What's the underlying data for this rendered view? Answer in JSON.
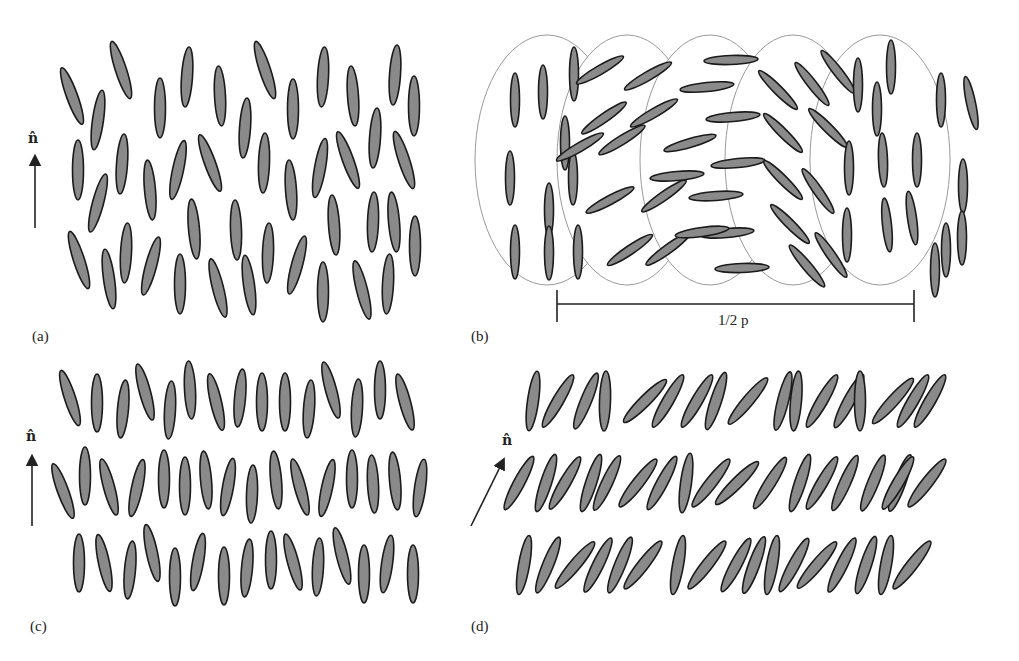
{
  "panels": {
    "a": {
      "label": "(a)",
      "director": "n̂"
    },
    "b": {
      "label": "(b)",
      "pitch_label": "1/2 p"
    },
    "c": {
      "label": "(c)",
      "director": "n̂"
    },
    "d": {
      "label": "(d)",
      "director": "n̂"
    }
  },
  "colors": {
    "molecule_fill": "#8a8a8a",
    "molecule_stroke": "#1a1a1a",
    "circle_stroke": "#9a9a9a",
    "ink": "#222222"
  },
  "molecule": {
    "rx": 5.5,
    "ry": 30
  },
  "molecules": {
    "a": [
      [
        72,
        96,
        -20
      ],
      [
        98,
        120,
        8
      ],
      [
        121,
        70,
        -18
      ],
      [
        160,
        108,
        0
      ],
      [
        187,
        77,
        4
      ],
      [
        220,
        96,
        -3
      ],
      [
        265,
        70,
        -18
      ],
      [
        293,
        109,
        0
      ],
      [
        323,
        77,
        3
      ],
      [
        353,
        96,
        -4
      ],
      [
        395,
        75,
        4
      ],
      [
        414,
        106,
        0
      ],
      [
        78,
        170,
        0
      ],
      [
        98,
        203,
        15
      ],
      [
        122,
        164,
        4
      ],
      [
        150,
        190,
        -5
      ],
      [
        178,
        170,
        12
      ],
      [
        210,
        163,
        -20
      ],
      [
        245,
        128,
        4
      ],
      [
        264,
        163,
        2
      ],
      [
        291,
        190,
        -4
      ],
      [
        320,
        168,
        10
      ],
      [
        348,
        160,
        -20
      ],
      [
        375,
        138,
        4
      ],
      [
        404,
        160,
        -18
      ],
      [
        79,
        260,
        -18
      ],
      [
        109,
        279,
        -8
      ],
      [
        126,
        253,
        3
      ],
      [
        151,
        266,
        15
      ],
      [
        180,
        284,
        0
      ],
      [
        194,
        229,
        -5
      ],
      [
        218,
        288,
        -14
      ],
      [
        236,
        230,
        -2
      ],
      [
        249,
        285,
        -8
      ],
      [
        268,
        253,
        2
      ],
      [
        297,
        265,
        15
      ],
      [
        323,
        292,
        0
      ],
      [
        334,
        225,
        -4
      ],
      [
        362,
        290,
        -14
      ],
      [
        373,
        222,
        2
      ],
      [
        394,
        222,
        -5
      ],
      [
        388,
        284,
        3
      ],
      [
        415,
        246,
        0
      ]
    ],
    "c": [
      [
        70,
        398,
        -18
      ],
      [
        97,
        403,
        0
      ],
      [
        123,
        409,
        5
      ],
      [
        145,
        392,
        -15
      ],
      [
        170,
        410,
        3
      ],
      [
        190,
        390,
        -3
      ],
      [
        216,
        402,
        -13
      ],
      [
        240,
        398,
        5
      ],
      [
        262,
        402,
        0
      ],
      [
        285,
        402,
        0
      ],
      [
        309,
        409,
        4
      ],
      [
        331,
        390,
        -15
      ],
      [
        357,
        408,
        3
      ],
      [
        380,
        390,
        0
      ],
      [
        405,
        402,
        -15
      ],
      [
        63,
        491,
        -20
      ],
      [
        85,
        476,
        0
      ],
      [
        109,
        487,
        -15
      ],
      [
        137,
        488,
        12
      ],
      [
        164,
        479,
        0
      ],
      [
        185,
        486,
        0
      ],
      [
        206,
        480,
        -5
      ],
      [
        228,
        487,
        10
      ],
      [
        252,
        494,
        2
      ],
      [
        276,
        480,
        -5
      ],
      [
        300,
        487,
        -15
      ],
      [
        327,
        488,
        12
      ],
      [
        352,
        479,
        0
      ],
      [
        373,
        484,
        -3
      ],
      [
        395,
        481,
        -5
      ],
      [
        420,
        488,
        8
      ],
      [
        79,
        563,
        0
      ],
      [
        104,
        563,
        -12
      ],
      [
        130,
        570,
        5
      ],
      [
        152,
        553,
        -12
      ],
      [
        175,
        577,
        0
      ],
      [
        198,
        562,
        10
      ],
      [
        224,
        576,
        0
      ],
      [
        247,
        568,
        5
      ],
      [
        271,
        560,
        0
      ],
      [
        293,
        562,
        -15
      ],
      [
        318,
        567,
        3
      ],
      [
        342,
        556,
        -14
      ],
      [
        364,
        574,
        0
      ],
      [
        387,
        564,
        8
      ],
      [
        413,
        574,
        0
      ]
    ]
  },
  "smecticC_rows": [
    {
      "y": 401,
      "xs": [
        533,
        558,
        586,
        605,
        645,
        668,
        697,
        716,
        748,
        783,
        796,
        822,
        849,
        860,
        893,
        913,
        930
      ],
      "angles": [
        8,
        30,
        22,
        2,
        45,
        30,
        30,
        18,
        40,
        14,
        5,
        30,
        28,
        0,
        42,
        30,
        30
      ]
    },
    {
      "y": 483,
      "xs": [
        519,
        546,
        565,
        591,
        607,
        638,
        662,
        686,
        711,
        737,
        770,
        800,
        822,
        845,
        873,
        900,
        898,
        927
      ],
      "angles": [
        28,
        18,
        30,
        18,
        25,
        38,
        28,
        8,
        38,
        45,
        32,
        18,
        30,
        24,
        22,
        20,
        30,
        38
      ]
    },
    {
      "y": 565,
      "xs": [
        524,
        548,
        575,
        598,
        620,
        643,
        678,
        707,
        736,
        754,
        772,
        794,
        817,
        842,
        866,
        886,
        912
      ],
      "angles": [
        10,
        22,
        40,
        26,
        22,
        38,
        10,
        38,
        28,
        20,
        10,
        28,
        40,
        26,
        18,
        10,
        38
      ]
    }
  ],
  "cholesteric": {
    "circles": [
      [
        547,
        160,
        72,
        125
      ],
      [
        627,
        160,
        70,
        125
      ],
      [
        710,
        160,
        70,
        125
      ],
      [
        793,
        160,
        68,
        125
      ],
      [
        880,
        160,
        70,
        125
      ]
    ],
    "molecules": [
      [
        515,
        100,
        0
      ],
      [
        510,
        178,
        0
      ],
      [
        515,
        252,
        0
      ],
      [
        543,
        92,
        0
      ],
      [
        565,
        143,
        0
      ],
      [
        549,
        210,
        0
      ],
      [
        549,
        253,
        0
      ],
      [
        573,
        178,
        0
      ],
      [
        578,
        252,
        0
      ],
      [
        574,
        74,
        0
      ],
      [
        600,
        70,
        60
      ],
      [
        648,
        76,
        60
      ],
      [
        604,
        118,
        55
      ],
      [
        654,
        113,
        60
      ],
      [
        580,
        147,
        60
      ],
      [
        622,
        140,
        58
      ],
      [
        610,
        200,
        62
      ],
      [
        664,
        196,
        55
      ],
      [
        630,
        250,
        56
      ],
      [
        668,
        249,
        54
      ],
      [
        731,
        60,
        88
      ],
      [
        707,
        87,
        84
      ],
      [
        733,
        117,
        85
      ],
      [
        690,
        143,
        74
      ],
      [
        677,
        176,
        85
      ],
      [
        716,
        196,
        86
      ],
      [
        727,
        233,
        85
      ],
      [
        702,
        232,
        82
      ],
      [
        742,
        268,
        88
      ],
      [
        738,
        163,
        84
      ],
      [
        778,
        90,
        -45
      ],
      [
        812,
        84,
        -38
      ],
      [
        783,
        133,
        -45
      ],
      [
        828,
        128,
        -45
      ],
      [
        783,
        180,
        -45
      ],
      [
        818,
        191,
        -35
      ],
      [
        790,
        224,
        -45
      ],
      [
        807,
        266,
        -40
      ],
      [
        831,
        255,
        -35
      ],
      [
        838,
        72,
        -38
      ],
      [
        891,
        67,
        0
      ],
      [
        858,
        85,
        0
      ],
      [
        877,
        109,
        0
      ],
      [
        941,
        100,
        0
      ],
      [
        971,
        103,
        -12
      ],
      [
        883,
        160,
        -2
      ],
      [
        917,
        160,
        0
      ],
      [
        849,
        168,
        0
      ],
      [
        912,
        218,
        -8
      ],
      [
        963,
        186,
        0
      ],
      [
        887,
        225,
        -6
      ],
      [
        946,
        250,
        0
      ],
      [
        962,
        238,
        0
      ],
      [
        935,
        270,
        0
      ],
      [
        847,
        235,
        0
      ]
    ]
  },
  "pitch_bar": {
    "x1": 557,
    "x2": 914,
    "y": 304
  }
}
